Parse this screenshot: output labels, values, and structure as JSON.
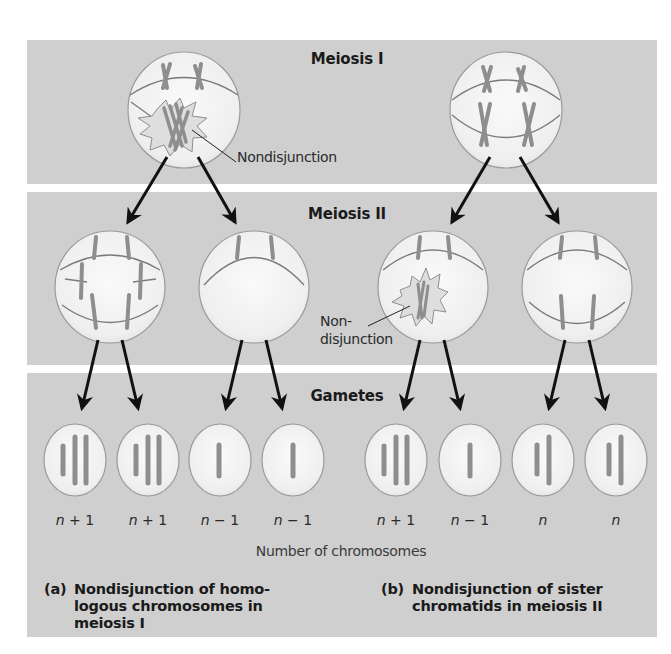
{
  "figure": {
    "stages": {
      "meiosis_1": "Meiosis I",
      "meiosis_2": "Meiosis II",
      "gametes": "Gametes"
    },
    "annotations": {
      "nondisjunction_meiosis_1": "Nondisjunction",
      "nondisjunction_meiosis_2_line1": "Non-",
      "nondisjunction_meiosis_2_line2": "disjunction"
    },
    "gamete_counts": [
      {
        "var": "n",
        "op": "+ 1"
      },
      {
        "var": "n",
        "op": "+ 1"
      },
      {
        "var": "n",
        "op": "− 1"
      },
      {
        "var": "n",
        "op": "− 1"
      },
      {
        "var": "n",
        "op": "+ 1"
      },
      {
        "var": "n",
        "op": "− 1"
      },
      {
        "var": "n",
        "op": ""
      },
      {
        "var": "n",
        "op": ""
      }
    ],
    "axis_label": "Number of chromosomes",
    "captions": {
      "a_tag": "(a)",
      "a_text": "Nondisjunction of homo-\nlogous chromosomes in\nmeiosis I",
      "b_tag": "(b)",
      "b_text": "Nondisjunction of sister\nchromatids in meiosis II"
    },
    "colors": {
      "band": "#cfcfcf",
      "separator": "#ffffff",
      "cell_fill": "#f2f2f2",
      "cell_outline": "#9a9a9a",
      "chromosome": "#8e8e8e",
      "spindle": "#7a7a7a",
      "arrow": "#111111"
    }
  }
}
